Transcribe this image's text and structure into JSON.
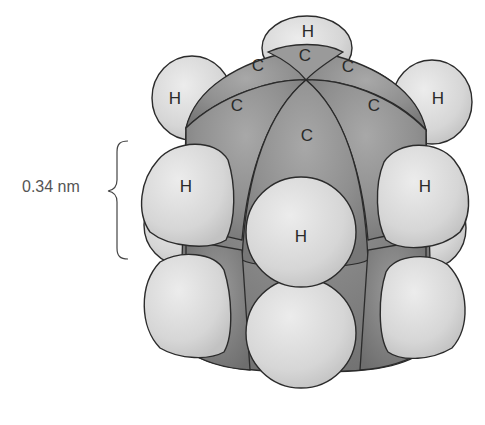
{
  "diagram": {
    "title": "",
    "type": "space-filling molecular model",
    "dimension": {
      "label": "0.34 nm",
      "bracket": "curly-brace"
    },
    "atoms": {
      "top_h": "H",
      "top_c": "C",
      "upper_left_c": "C",
      "upper_right_c": "C",
      "left_c": "C",
      "right_c": "C",
      "front_c": "C",
      "far_left_h": "H",
      "far_right_h": "H",
      "mid_left_h": "H",
      "mid_right_h": "H",
      "front_h": "H"
    },
    "colors": {
      "carbon": "#8e8e8e",
      "hydrogen": "#dcdcdc",
      "outline": "#2b2b2b",
      "label": "#2a2a2a",
      "background": "#ffffff"
    }
  }
}
